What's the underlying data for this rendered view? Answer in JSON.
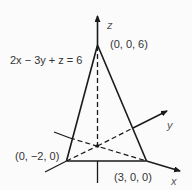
{
  "diagram": {
    "equation_label": "2x − 3y + z = 6",
    "axes": {
      "z": "z",
      "y": "y",
      "x": "x"
    },
    "points": {
      "z_intercept": "(0,  0,  6)",
      "y_intercept": "(0,  −2,  0)",
      "x_intercept": "(3,  0,  0)"
    },
    "colors": {
      "line": "#1a1a1a",
      "text": "#333333",
      "background": "#fbfbfb"
    }
  }
}
